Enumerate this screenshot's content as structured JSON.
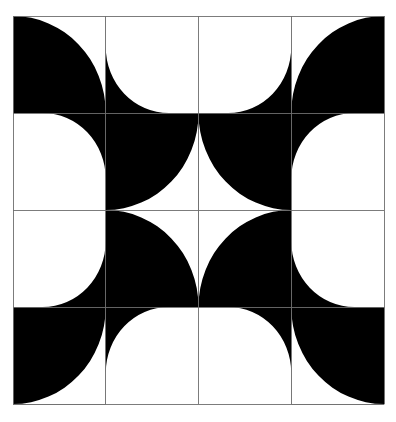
{
  "figure": {
    "canvas": {
      "width": 396,
      "height": 422
    },
    "frame": {
      "x": 13,
      "y": 16,
      "width": 371,
      "height": 388
    },
    "colors": {
      "ink": "#000000",
      "paper": "#ffffff",
      "grid_line": "#6e6e6e"
    },
    "grid": {
      "rows": 4,
      "cols": 4,
      "cell_width": 92.75,
      "cell_height": 97,
      "line_width": 0.9,
      "show_grid": true
    },
    "tiles": [
      {
        "row": 0,
        "col": 0,
        "background": "ink",
        "arc_corner": "top-right",
        "arc_fill": "paper",
        "radius_ratio": 1.0
      },
      {
        "row": 0,
        "col": 1,
        "background": "paper",
        "arc_corner": "bottom-left",
        "arc_fill": "ink",
        "radius_ratio": 0.68
      },
      {
        "row": 0,
        "col": 2,
        "background": "paper",
        "arc_corner": "bottom-right",
        "arc_fill": "ink",
        "radius_ratio": 0.68
      },
      {
        "row": 0,
        "col": 3,
        "background": "ink",
        "arc_corner": "top-left",
        "arc_fill": "paper",
        "radius_ratio": 1.0
      },
      {
        "row": 1,
        "col": 0,
        "background": "paper",
        "arc_corner": "top-right",
        "arc_fill": "ink",
        "radius_ratio": 0.68
      },
      {
        "row": 1,
        "col": 1,
        "background": "ink",
        "arc_corner": "bottom-right",
        "arc_fill": "paper",
        "radius_ratio": 1.0
      },
      {
        "row": 1,
        "col": 2,
        "background": "ink",
        "arc_corner": "bottom-left",
        "arc_fill": "paper",
        "radius_ratio": 1.0
      },
      {
        "row": 1,
        "col": 3,
        "background": "paper",
        "arc_corner": "top-left",
        "arc_fill": "ink",
        "radius_ratio": 0.68
      },
      {
        "row": 2,
        "col": 0,
        "background": "paper",
        "arc_corner": "bottom-right",
        "arc_fill": "ink",
        "radius_ratio": 0.68
      },
      {
        "row": 2,
        "col": 1,
        "background": "ink",
        "arc_corner": "top-right",
        "arc_fill": "paper",
        "radius_ratio": 1.0
      },
      {
        "row": 2,
        "col": 2,
        "background": "ink",
        "arc_corner": "top-left",
        "arc_fill": "paper",
        "radius_ratio": 1.0
      },
      {
        "row": 2,
        "col": 3,
        "background": "paper",
        "arc_corner": "bottom-left",
        "arc_fill": "ink",
        "radius_ratio": 0.68
      },
      {
        "row": 3,
        "col": 0,
        "background": "ink",
        "arc_corner": "bottom-right",
        "arc_fill": "paper",
        "radius_ratio": 1.0
      },
      {
        "row": 3,
        "col": 1,
        "background": "paper",
        "arc_corner": "top-left",
        "arc_fill": "ink",
        "radius_ratio": 0.68
      },
      {
        "row": 3,
        "col": 2,
        "background": "paper",
        "arc_corner": "top-right",
        "arc_fill": "ink",
        "radius_ratio": 0.68
      },
      {
        "row": 3,
        "col": 3,
        "background": "ink",
        "arc_corner": "bottom-left",
        "arc_fill": "paper",
        "radius_ratio": 1.0
      }
    ]
  }
}
